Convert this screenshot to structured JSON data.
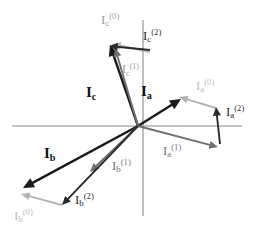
{
  "figure": {
    "type": "phasor-vector-diagram",
    "width": 270,
    "height": 235,
    "background": "#ffffff"
  },
  "colors": {
    "dark": "#1a1a1a",
    "mid_gray": "#6b6b6b",
    "light_gray": "#a8a8a8",
    "pale_gray": "#bdbdbd",
    "axis": "#8a8a8a"
  },
  "axes": {
    "origin": {
      "x": 138,
      "y": 126
    },
    "horizontal": {
      "x1": 12,
      "y1": 126,
      "x2": 242,
      "y2": 126,
      "color": "#8a8a8a"
    },
    "vertical": {
      "x1": 143,
      "y1": 20,
      "x2": 143,
      "y2": 216,
      "color": "#8a8a8a"
    }
  },
  "vectors": [
    {
      "id": "Ia",
      "name": "phasor-Ia",
      "label": "I",
      "sub": "a",
      "sup": "",
      "style": "bold-dark",
      "color": "#1a1a1a",
      "width": 2.4,
      "x1": 138,
      "y1": 126,
      "x2": 181,
      "y2": 99
    },
    {
      "id": "Ia0",
      "name": "phasor-Ia-zero-sequence",
      "label": "I",
      "sub": "a",
      "sup": "(0)",
      "style": "light",
      "color": "#b4b4b4",
      "width": 1.9,
      "x1": 216,
      "y1": 108,
      "x2": 179,
      "y2": 97
    },
    {
      "id": "Ia1",
      "name": "phasor-Ia-positive-sequence",
      "label": "I",
      "sub": "a",
      "sup": "(1)",
      "style": "mid",
      "color": "#707070",
      "width": 1.9,
      "x1": 138,
      "y1": 126,
      "x2": 218,
      "y2": 147
    },
    {
      "id": "Ia2",
      "name": "phasor-Ia-negative-sequence",
      "label": "I",
      "sub": "a",
      "sup": "(2)",
      "style": "dark",
      "color": "#2b2b2b",
      "width": 1.9,
      "x1": 220,
      "y1": 144,
      "x2": 216,
      "y2": 107
    },
    {
      "id": "Ib",
      "name": "phasor-Ib",
      "label": "I",
      "sub": "b",
      "sup": "",
      "style": "bold-dark",
      "color": "#1a1a1a",
      "width": 2.4,
      "x1": 138,
      "y1": 126,
      "x2": 23,
      "y2": 188
    },
    {
      "id": "Ib0",
      "name": "phasor-Ib-zero-sequence",
      "label": "I",
      "sub": "b",
      "sup": "(0)",
      "style": "light",
      "color": "#b4b4b4",
      "width": 1.9,
      "x1": 62,
      "y1": 205,
      "x2": 21,
      "y2": 194
    },
    {
      "id": "Ib1",
      "name": "phasor-Ib-positive-sequence",
      "label": "I",
      "sub": "b",
      "sup": "(1)",
      "style": "mid",
      "color": "#707070",
      "width": 1.9,
      "x1": 138,
      "y1": 126,
      "x2": 90,
      "y2": 172
    },
    {
      "id": "Ib2",
      "name": "phasor-Ib-negative-sequence",
      "label": "I",
      "sub": "b",
      "sup": "(2)",
      "style": "dark",
      "color": "#2b2b2b",
      "width": 1.9,
      "x1": 138,
      "y1": 126,
      "x2": 62,
      "y2": 205
    },
    {
      "id": "Ic",
      "name": "phasor-Ic",
      "label": "I",
      "sub": "c",
      "sup": "",
      "style": "bold-dark",
      "color": "#1a1a1a",
      "width": 2.4,
      "x1": 138,
      "y1": 126,
      "x2": 110,
      "y2": 45
    },
    {
      "id": "Ic0",
      "name": "phasor-Ic-zero-sequence",
      "label": "I",
      "sub": "c",
      "sup": "(0)",
      "style": "light",
      "color": "#b4b4b4",
      "width": 1.9,
      "x1": 150,
      "y1": 52,
      "x2": 112,
      "y2": 44
    },
    {
      "id": "Ic1",
      "name": "phasor-Ic-positive-sequence",
      "label": "I",
      "sub": "c",
      "sup": "(1)",
      "style": "mid",
      "color": "#707070",
      "width": 1.9,
      "x1": 138,
      "y1": 126,
      "x2": 115,
      "y2": 48
    },
    {
      "id": "Ic2",
      "name": "phasor-Ic-negative-sequence",
      "label": "I",
      "sub": "c",
      "sup": "(2)",
      "style": "dark",
      "color": "#2b2b2b",
      "width": 1.9,
      "x1": 150,
      "y1": 50,
      "x2": 109,
      "y2": 46
    }
  ],
  "labels": [
    {
      "id": "lbl-Ic0",
      "name": "label-Ic-zero-sequence",
      "base": "I",
      "sub": "c",
      "sup": "(0)",
      "x": 101,
      "y": 12,
      "size": 13,
      "color": "#9c9c9c",
      "bold": false
    },
    {
      "id": "lbl-Ic2",
      "name": "label-Ic-negative-sequence",
      "base": "I",
      "sub": "c",
      "sup": "(2)",
      "x": 143,
      "y": 28,
      "size": 13,
      "color": "#2b2b2b",
      "bold": false
    },
    {
      "id": "lbl-Ic1",
      "name": "label-Ic-positive-sequence",
      "base": "I",
      "sub": "c",
      "sup": "(1)",
      "x": 122,
      "y": 63,
      "size": 12,
      "color": "#9c9c9c",
      "bold": false
    },
    {
      "id": "lbl-Ic",
      "name": "label-Ic",
      "base": "I",
      "sub": "c",
      "sup": "",
      "x": 86,
      "y": 85,
      "size": 15,
      "color": "#111111",
      "bold": true
    },
    {
      "id": "lbl-Ia",
      "name": "label-Ia",
      "base": "I",
      "sub": "a",
      "sup": "",
      "x": 141,
      "y": 84,
      "size": 15,
      "color": "#111111",
      "bold": true
    },
    {
      "id": "lbl-Ia0",
      "name": "label-Ia-zero-sequence",
      "base": "I",
      "sub": "a",
      "sup": "(0)",
      "x": 196,
      "y": 78,
      "size": 13,
      "color": "#bcbcbc",
      "bold": false
    },
    {
      "id": "lbl-Ia2",
      "name": "label-Ia-negative-sequence",
      "base": "I",
      "sub": "a",
      "sup": "(2)",
      "x": 226,
      "y": 104,
      "size": 13,
      "color": "#2b2b2b",
      "bold": false
    },
    {
      "id": "lbl-Ia1",
      "name": "label-Ia-positive-sequence",
      "base": "I",
      "sub": "a",
      "sup": "(1)",
      "x": 163,
      "y": 143,
      "size": 13,
      "color": "#777777",
      "bold": false
    },
    {
      "id": "lbl-Ib",
      "name": "label-Ib",
      "base": "I",
      "sub": "b",
      "sup": "",
      "x": 44,
      "y": 146,
      "size": 15,
      "color": "#111111",
      "bold": true
    },
    {
      "id": "lbl-Ib1",
      "name": "label-Ib-positive-sequence",
      "base": "I",
      "sub": "b",
      "sup": "(1)",
      "x": 112,
      "y": 158,
      "size": 13,
      "color": "#777777",
      "bold": false
    },
    {
      "id": "lbl-Ib2",
      "name": "label-Ib-negative-sequence",
      "base": "I",
      "sub": "b",
      "sup": "(2)",
      "x": 75,
      "y": 192,
      "size": 13,
      "color": "#2b2b2b",
      "bold": false
    },
    {
      "id": "lbl-Ib0",
      "name": "label-Ib-zero-sequence",
      "base": "I",
      "sub": "b",
      "sup": "(0)",
      "x": 14,
      "y": 208,
      "size": 13,
      "color": "#bcbcbc",
      "bold": false
    }
  ]
}
